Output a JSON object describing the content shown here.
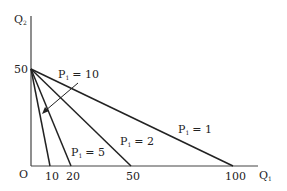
{
  "diagram": {
    "title": "",
    "axes": {
      "x_label": "Q",
      "x_label_sub": "1",
      "y_label": "Q",
      "y_label_sub": "2",
      "origin_label": "O",
      "y_tick": "50",
      "x_ticks": [
        "10",
        "20",
        "50",
        "100"
      ]
    },
    "lines": [
      {
        "label": "P",
        "sub": "1",
        "value": "= 10",
        "x_intercept": 10
      },
      {
        "label": "P",
        "sub": "1",
        "value": "= 5",
        "x_intercept": 20
      },
      {
        "label": "P",
        "sub": "1",
        "value": "= 2",
        "x_intercept": 50
      },
      {
        "label": "P",
        "sub": "1",
        "value": "= 1",
        "x_intercept": 100
      }
    ],
    "line_color": "#222222"
  }
}
